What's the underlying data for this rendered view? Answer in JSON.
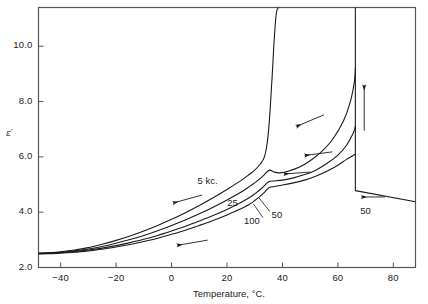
{
  "chart_data": {
    "type": "line",
    "title": "",
    "xlabel": "Temperature, °C.",
    "ylabel": "ε′",
    "xlim": [
      -48,
      88
    ],
    "ylim": [
      2.0,
      11.4
    ],
    "grid": false,
    "legend": "inline-curve-labels",
    "xticks": [
      -40,
      -20,
      0,
      20,
      40,
      60,
      80
    ],
    "xtick_labels": [
      "−40",
      "−20",
      "0",
      "20",
      "40",
      "60",
      "80"
    ],
    "yticks": [
      2.0,
      4.0,
      6.0,
      8.0,
      10.0
    ],
    "ytick_labels": [
      "2.0",
      "4.0",
      "6.0",
      "8.0",
      "10.0"
    ],
    "series": [
      {
        "name": "5 kc.",
        "label": "5 kc.",
        "points": [
          [
            -48,
            2.52
          ],
          [
            -44,
            2.54
          ],
          [
            -40,
            2.57
          ],
          [
            -35,
            2.63
          ],
          [
            -30,
            2.72
          ],
          [
            -25,
            2.84
          ],
          [
            -20,
            2.98
          ],
          [
            -15,
            3.14
          ],
          [
            -10,
            3.32
          ],
          [
            -5,
            3.52
          ],
          [
            0,
            3.74
          ],
          [
            5,
            3.98
          ],
          [
            10,
            4.24
          ],
          [
            15,
            4.52
          ],
          [
            20,
            4.82
          ],
          [
            25,
            5.14
          ],
          [
            28,
            5.36
          ],
          [
            30,
            5.52
          ],
          [
            32,
            5.74
          ],
          [
            33.5,
            6.0
          ],
          [
            34.5,
            6.5
          ],
          [
            35.2,
            7.2
          ],
          [
            35.8,
            8.1
          ],
          [
            36.4,
            9.1
          ],
          [
            37,
            10.2
          ],
          [
            37.8,
            11.2
          ],
          [
            38.6,
            11.4
          ]
        ]
      },
      {
        "name": "25",
        "label": "25",
        "points": [
          [
            -48,
            2.51
          ],
          [
            -44,
            2.53
          ],
          [
            -40,
            2.55
          ],
          [
            -35,
            2.6
          ],
          [
            -30,
            2.67
          ],
          [
            -25,
            2.76
          ],
          [
            -20,
            2.88
          ],
          [
            -15,
            3.01
          ],
          [
            -10,
            3.16
          ],
          [
            -5,
            3.33
          ],
          [
            0,
            3.52
          ],
          [
            5,
            3.72
          ],
          [
            10,
            3.94
          ],
          [
            15,
            4.18
          ],
          [
            20,
            4.44
          ],
          [
            25,
            4.72
          ],
          [
            28,
            4.92
          ],
          [
            30,
            5.06
          ],
          [
            32,
            5.22
          ],
          [
            33.5,
            5.36
          ],
          [
            34.5,
            5.46
          ],
          [
            35.5,
            5.52
          ],
          [
            37,
            5.45
          ],
          [
            39,
            5.42
          ],
          [
            42,
            5.48
          ],
          [
            46,
            5.62
          ],
          [
            50,
            5.86
          ],
          [
            54,
            6.18
          ],
          [
            58,
            6.62
          ],
          [
            62,
            7.3
          ],
          [
            64.5,
            8.0
          ],
          [
            66,
            8.75
          ],
          [
            66.3,
            9.2
          ]
        ]
      },
      {
        "name": "50",
        "label": "50",
        "points": [
          [
            -48,
            2.5
          ],
          [
            -44,
            2.52
          ],
          [
            -40,
            2.54
          ],
          [
            -35,
            2.58
          ],
          [
            -30,
            2.63
          ],
          [
            -25,
            2.7
          ],
          [
            -20,
            2.79
          ],
          [
            -15,
            2.9
          ],
          [
            -10,
            3.02
          ],
          [
            -5,
            3.16
          ],
          [
            0,
            3.32
          ],
          [
            5,
            3.49
          ],
          [
            10,
            3.68
          ],
          [
            15,
            3.88
          ],
          [
            20,
            4.1
          ],
          [
            25,
            4.35
          ],
          [
            28,
            4.52
          ],
          [
            30,
            4.66
          ],
          [
            32,
            4.82
          ],
          [
            33.5,
            4.96
          ],
          [
            34.5,
            5.06
          ],
          [
            35.5,
            5.12
          ],
          [
            37,
            5.13
          ],
          [
            40,
            5.16
          ],
          [
            44,
            5.24
          ],
          [
            48,
            5.36
          ],
          [
            52,
            5.52
          ],
          [
            56,
            5.76
          ],
          [
            60,
            6.06
          ],
          [
            63,
            6.4
          ],
          [
            65.5,
            6.85
          ],
          [
            66.3,
            7.1
          ]
        ]
      },
      {
        "name": "100",
        "label": "100",
        "points": [
          [
            -48,
            2.49
          ],
          [
            -44,
            2.5
          ],
          [
            -40,
            2.52
          ],
          [
            -35,
            2.55
          ],
          [
            -30,
            2.6
          ],
          [
            -25,
            2.66
          ],
          [
            -20,
            2.74
          ],
          [
            -15,
            2.83
          ],
          [
            -10,
            2.94
          ],
          [
            -5,
            3.06
          ],
          [
            0,
            3.2
          ],
          [
            5,
            3.35
          ],
          [
            10,
            3.52
          ],
          [
            15,
            3.7
          ],
          [
            20,
            3.9
          ],
          [
            25,
            4.12
          ],
          [
            28,
            4.28
          ],
          [
            30,
            4.42
          ],
          [
            32,
            4.58
          ],
          [
            33.5,
            4.72
          ],
          [
            34.5,
            4.83
          ],
          [
            35.5,
            4.9
          ],
          [
            37,
            4.93
          ],
          [
            40,
            4.98
          ],
          [
            44,
            5.06
          ],
          [
            48,
            5.16
          ],
          [
            52,
            5.3
          ],
          [
            56,
            5.48
          ],
          [
            60,
            5.7
          ],
          [
            63,
            5.9
          ],
          [
            65.5,
            6.05
          ],
          [
            66.3,
            6.1
          ]
        ]
      },
      {
        "name": "50-cooling-branch",
        "label": "50",
        "points": [
          [
            66.3,
            11.4
          ],
          [
            66.3,
            4.78
          ],
          [
            88,
            4.38
          ]
        ]
      }
    ],
    "annotations": [
      {
        "text": "5 kc.",
        "x": 13,
        "y": 5.08
      },
      {
        "text": "25",
        "x": 22,
        "y": 4.3
      },
      {
        "text": "50",
        "x": 38,
        "y": 3.85
      },
      {
        "text": "100",
        "x": 29,
        "y": 3.63
      },
      {
        "text": "50",
        "x": 70,
        "y": 4.0
      }
    ],
    "arrows": [
      {
        "name": "arrow-5kc-down-left",
        "x1": 11.0,
        "y1": 4.62,
        "x2": 0.5,
        "y2": 4.33
      },
      {
        "name": "arrow-lowfreq-left",
        "x1": 13.0,
        "y1": 2.99,
        "x2": 2.0,
        "y2": 2.8
      },
      {
        "name": "arrow-upper-left-1",
        "x1": 55.0,
        "y1": 7.52,
        "x2": 45.0,
        "y2": 7.1
      },
      {
        "name": "arrow-mid-left-2",
        "x1": 58.0,
        "y1": 6.18,
        "x2": 48.0,
        "y2": 6.05
      },
      {
        "name": "arrow-mid-left-3",
        "x1": 50.0,
        "y1": 5.45,
        "x2": 40.5,
        "y2": 5.38
      },
      {
        "name": "arrow-vertical-up",
        "x1": 69.5,
        "y1": 6.95,
        "x2": 69.5,
        "y2": 8.6
      },
      {
        "name": "arrow-bottom-left-50",
        "x1": 77.0,
        "y1": 4.55,
        "x2": 68.5,
        "y2": 4.55
      }
    ]
  },
  "axis": {
    "x_title": "Temperature, °C.",
    "y_title": "ε′"
  },
  "colors": {
    "ink": "#1a1a1a",
    "frame": "#555555",
    "background": "#ffffff"
  }
}
